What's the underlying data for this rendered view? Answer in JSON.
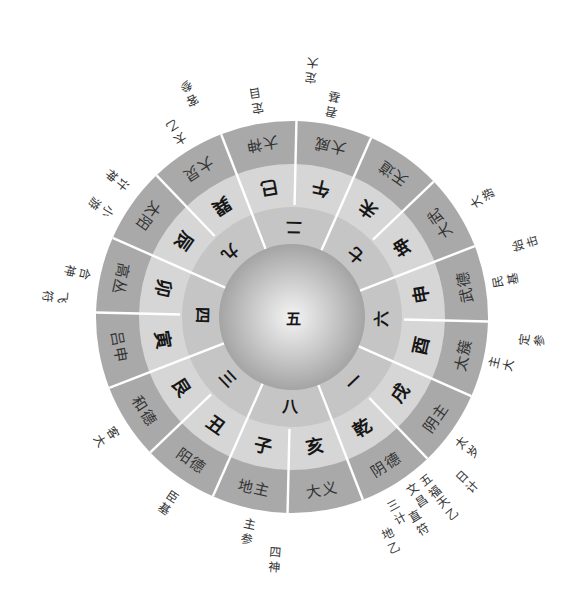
{
  "diagram": {
    "center": {
      "label": "五"
    },
    "numbers": [
      {
        "label": "二",
        "angle": 0
      },
      {
        "label": "七",
        "angle": 45
      },
      {
        "label": "六",
        "angle": 90
      },
      {
        "label": "一",
        "angle": 135
      },
      {
        "label": "八",
        "angle": 180
      },
      {
        "label": "三",
        "angle": 225
      },
      {
        "label": "四",
        "angle": 270
      },
      {
        "label": "九",
        "angle": 315
      }
    ],
    "sectors": [
      {
        "palace": "午",
        "god": "大威",
        "angle": 11.25
      },
      {
        "palace": "未",
        "god": "天道",
        "angle": 33.75
      },
      {
        "palace": "坤",
        "god": "大武",
        "angle": 56.25
      },
      {
        "palace": "申",
        "god": "武德",
        "angle": 78.75
      },
      {
        "palace": "酉",
        "god": "太簇",
        "angle": 101.25
      },
      {
        "palace": "戌",
        "god": "阴主",
        "angle": 123.75
      },
      {
        "palace": "乾",
        "god": "阴德",
        "angle": 146.25
      },
      {
        "palace": "亥",
        "god": "大义",
        "angle": 168.75
      },
      {
        "palace": "子",
        "god": "地主",
        "angle": 191.25
      },
      {
        "palace": "丑",
        "god": "阳德",
        "angle": 213.75
      },
      {
        "palace": "艮",
        "god": "和德",
        "angle": 236.25
      },
      {
        "palace": "寅",
        "god": "吕申",
        "angle": 258.75
      },
      {
        "palace": "卯",
        "god": "高丛",
        "angle": 281.25
      },
      {
        "palace": "辰",
        "god": "太阳",
        "angle": 303.75
      },
      {
        "palace": "巽",
        "god": "大炅",
        "angle": 326.25
      },
      {
        "palace": "巳",
        "god": "大神",
        "angle": 348.75
      }
    ],
    "outer_labels": [
      {
        "text": "定大",
        "angle": 3.6,
        "radius": 248
      },
      {
        "text": "君基",
        "angle": 10.0,
        "radius": 217
      },
      {
        "text": "大游",
        "angle": 57.1,
        "radius": 225
      },
      {
        "text": "始击",
        "angle": 71.5,
        "radius": 245
      },
      {
        "text": "民基",
        "angle": 79.3,
        "radius": 217
      },
      {
        "text": "定参",
        "angle": 94.6,
        "radius": 242
      },
      {
        "text": "主大",
        "angle": 101.7,
        "radius": 215
      },
      {
        "text": "太岁",
        "angle": 125.8,
        "radius": 219
      },
      {
        "text": "日计",
        "angle": 132.3,
        "radius": 241
      },
      {
        "text": "五福",
        "angle": 139.7,
        "radius": 219
      },
      {
        "text": "天乙",
        "angle": 139.9,
        "radius": 247
      },
      {
        "text": "文昌",
        "angle": 144.0,
        "radius": 218
      },
      {
        "text": "直符",
        "angle": 147.4,
        "radius": 242
      },
      {
        "text": "三计",
        "angle": 150.7,
        "radius": 222
      },
      {
        "text": "地乙",
        "angle": 155.3,
        "radius": 245
      },
      {
        "text": "四神",
        "angle": 183.2,
        "radius": 244
      },
      {
        "text": "主参",
        "angle": 190.6,
        "radius": 220
      },
      {
        "text": "臣基",
        "angle": 212.7,
        "radius": 224
      },
      {
        "text": "客大",
        "angle": 236.2,
        "radius": 222
      },
      {
        "text": "飞符",
        "angle": 274.0,
        "radius": 238
      },
      {
        "text": "合神",
        "angle": 280.9,
        "radius": 220
      },
      {
        "text": "小游",
        "angle": 298.9,
        "radius": 221
      },
      {
        "text": "计神",
        "angle": 307.2,
        "radius": 223
      },
      {
        "text": "太乙",
        "angle": 327.0,
        "radius": 219
      },
      {
        "text": "客参",
        "angle": 334.4,
        "radius": 247
      },
      {
        "text": "定目",
        "angle": 349.7,
        "radius": 220
      }
    ]
  },
  "theme": {
    "c-bg": "#ffffff",
    "c-outer": "#a9a9a9",
    "c-palace": "#d6d6d6",
    "c-number": "#c5c5c5",
    "c-disc-center": "#f4f4f4",
    "c-disc-mid": "#cdcdcd",
    "c-disc-edge": "#a4a4a4",
    "c-divider": "#ffffff",
    "c-text-strong": "#161616",
    "c-text": "#333333"
  }
}
